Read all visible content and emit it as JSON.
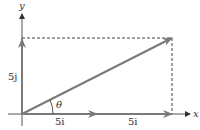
{
  "diagram": {
    "axes": {
      "x_label": "x",
      "y_label": "y"
    },
    "vectors": [
      {
        "name": "5j",
        "label": "5j",
        "direction": "vertical"
      },
      {
        "name": "5i-first",
        "label": "5i"
      },
      {
        "name": "5i-second",
        "label": "5i"
      },
      {
        "name": "resultant",
        "label": ""
      }
    ],
    "angle_label": "θ",
    "colors": {
      "vector": "#7a7a7a",
      "axis": "#555555",
      "dashed": "#444444"
    }
  }
}
